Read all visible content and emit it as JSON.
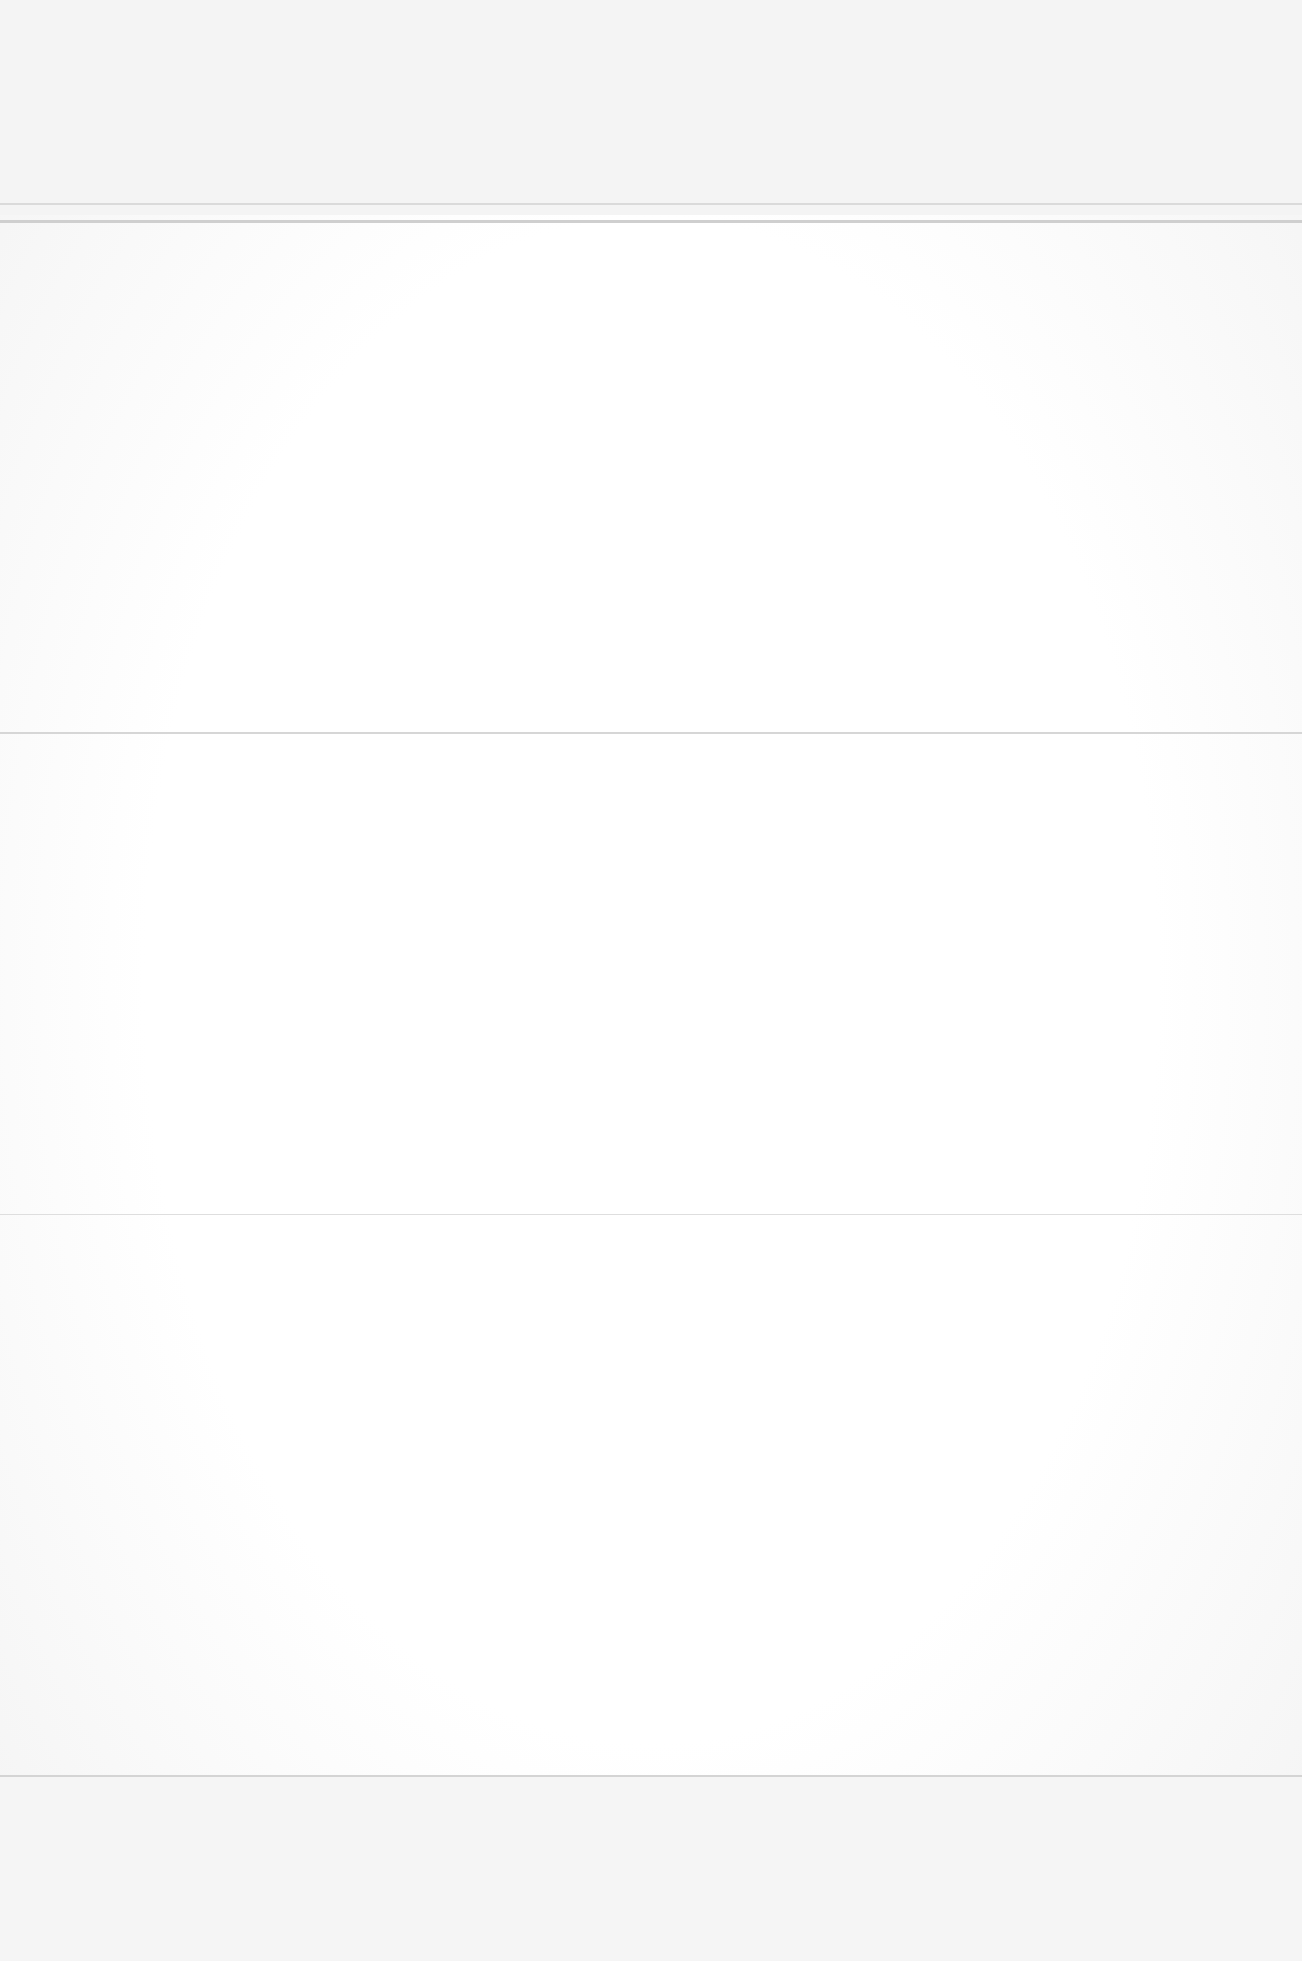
{
  "page": {
    "type": "blank-scanned-page",
    "background": "#fdfdfd",
    "edge_shade": "#f0f0f0",
    "rules": [
      {
        "y": 222,
        "thickness": 3,
        "color": "#d0d0d0"
      },
      {
        "y": 732,
        "thickness": 2,
        "color": "#d6d6d6"
      },
      {
        "y": 1214,
        "thickness": 1,
        "color": "#dedede"
      },
      {
        "y": 1775,
        "thickness": 2,
        "color": "#d4d4d4"
      }
    ]
  }
}
